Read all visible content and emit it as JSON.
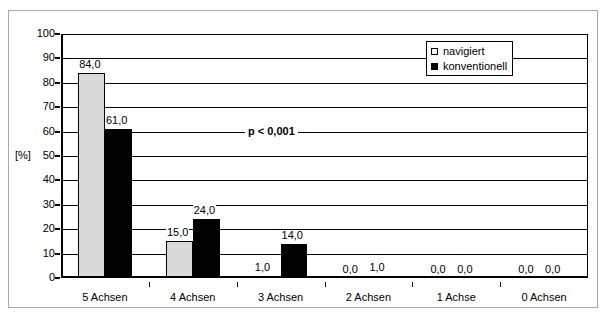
{
  "chart_data": {
    "type": "bar",
    "title": "",
    "xlabel": "",
    "ylabel": "[%]",
    "ylim": [
      0,
      100
    ],
    "ytick_step": 10,
    "yticks": [
      "100",
      "90",
      "80",
      "70",
      "60",
      "50",
      "40",
      "30",
      "20",
      "10",
      "0"
    ],
    "ytick_values": [
      100,
      90,
      80,
      70,
      60,
      50,
      40,
      30,
      20,
      10,
      0
    ],
    "grid": "horizontal",
    "legend_position": "top-right-inside",
    "categories": [
      "5 Achsen",
      "4 Achsen",
      "3 Achsen",
      "2 Achsen",
      "1 Achse",
      "0 Achsen"
    ],
    "series": [
      {
        "name": "navigiert",
        "color": "#d9d9d9",
        "values": [
          84.0,
          15.0,
          1.0,
          0.0,
          0.0,
          0.0
        ],
        "labels": [
          "84,0",
          "15,0",
          "1,0",
          "0,0",
          "0,0",
          "0,0"
        ]
      },
      {
        "name": "konventionell",
        "color": "#000000",
        "values": [
          61.0,
          24.0,
          14.0,
          1.0,
          0.0,
          0.0
        ],
        "labels": [
          "61,0",
          "24,0",
          "14,0",
          "1,0",
          "0,0",
          "0,0"
        ]
      }
    ],
    "annotations": [
      {
        "text": "p < 0,001",
        "bold": true
      }
    ]
  },
  "axis": {
    "y_title": "[%]"
  },
  "legend": {
    "entries": [
      {
        "label": "navigiert",
        "swatch": "light-gray-square"
      },
      {
        "label": "konventionell",
        "swatch": "black-square"
      }
    ]
  },
  "annotation": {
    "p_value": "p < 0,001"
  }
}
